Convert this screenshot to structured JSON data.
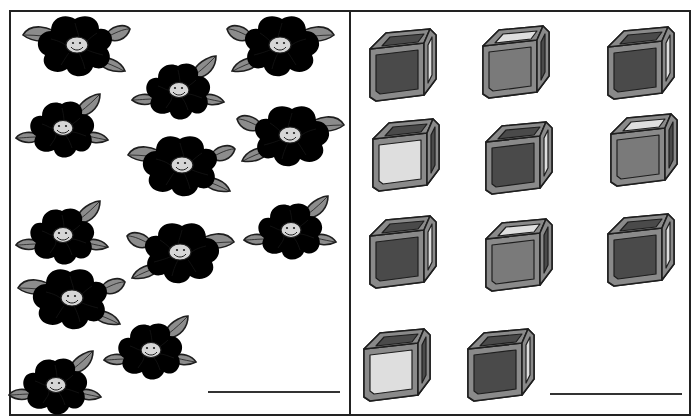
{
  "worksheet": {
    "title": "",
    "panels": [
      {
        "id": "flowers",
        "object": "flower",
        "count": 12,
        "answer": "",
        "items": [
          {
            "type": "light",
            "x": 75,
            "y": 45,
            "variant": "A"
          },
          {
            "type": "dark",
            "x": 178,
            "y": 90,
            "variant": "B"
          },
          {
            "type": "light",
            "x": 282,
            "y": 45,
            "variant": "A2"
          },
          {
            "type": "dark",
            "x": 62,
            "y": 128,
            "variant": "B"
          },
          {
            "type": "light",
            "x": 292,
            "y": 135,
            "variant": "A2"
          },
          {
            "type": "light",
            "x": 180,
            "y": 165,
            "variant": "A"
          },
          {
            "type": "dark",
            "x": 62,
            "y": 235,
            "variant": "B"
          },
          {
            "type": "light",
            "x": 182,
            "y": 252,
            "variant": "A2"
          },
          {
            "type": "dark",
            "x": 290,
            "y": 230,
            "variant": "B"
          },
          {
            "type": "light",
            "x": 70,
            "y": 298,
            "variant": "A"
          },
          {
            "type": "dark",
            "x": 150,
            "y": 350,
            "variant": "B"
          },
          {
            "type": "dark",
            "x": 55,
            "y": 385,
            "variant": "B"
          }
        ],
        "answer_line": {
          "x1": 208,
          "x2": 340,
          "y": 392
        }
      },
      {
        "id": "cubes",
        "object": "cube",
        "count": 11,
        "answer": "",
        "items": [
          {
            "type": "dark",
            "x": 402,
            "y": 65
          },
          {
            "type": "medium",
            "x": 515,
            "y": 62
          },
          {
            "type": "dark",
            "x": 640,
            "y": 63
          },
          {
            "type": "light",
            "x": 405,
            "y": 155
          },
          {
            "type": "dark",
            "x": 518,
            "y": 158
          },
          {
            "type": "medium",
            "x": 643,
            "y": 150
          },
          {
            "type": "dark",
            "x": 402,
            "y": 252
          },
          {
            "type": "medium",
            "x": 518,
            "y": 255
          },
          {
            "type": "dark",
            "x": 640,
            "y": 250
          },
          {
            "type": "light",
            "x": 396,
            "y": 365
          },
          {
            "type": "dark",
            "x": 500,
            "y": 365
          }
        ],
        "answer_line": {
          "x1": 550,
          "x2": 682,
          "y": 394
        }
      }
    ]
  },
  "colors": {
    "outline": "#1e1e1e",
    "flower_light": "#9a9a9a",
    "flower_dark": "#6a6a6a",
    "leaf": "#8c8c8c",
    "center": "#d6d6d6",
    "cube_frame": "#8a8a8a",
    "cube_dark": "#4a4a4a",
    "cube_medium": "#7a7a7a",
    "cube_light": "#dedede",
    "line": "#333333",
    "border": "#222222"
  }
}
